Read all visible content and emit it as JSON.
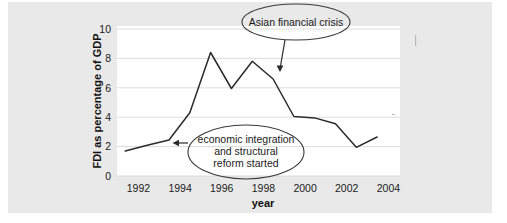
{
  "figure": {
    "background_color": "#e9e9e9",
    "plot_background_color": "#ffffff",
    "line_color": "#2a2a2a",
    "grid_color": "#d8d8d8"
  },
  "chart_data": {
    "type": "line",
    "title": "",
    "xlabel": "year",
    "ylabel": "FDI as percentage of GDP",
    "xlim": [
      1991,
      2004.6
    ],
    "ylim": [
      0,
      10
    ],
    "grid": true,
    "legend": "none",
    "xticks": [
      "1992",
      "1994",
      "1996",
      "1998",
      "2000",
      "2002",
      "2004"
    ],
    "xtick_values": [
      1992,
      1994,
      1996,
      1998,
      2000,
      2002,
      2004
    ],
    "yticks": [
      "0",
      "2",
      "4",
      "6",
      "8",
      "10"
    ],
    "ytick_values": [
      0,
      2,
      4,
      6,
      8,
      10
    ],
    "series": [
      {
        "name": "FDI as percentage of GDP",
        "x": [
          1991.4,
          1992.5,
          1993.5,
          1994.5,
          1995.5,
          1996.5,
          1997.5,
          1998.5,
          1999.5,
          2000.5,
          2001.5,
          2002.5,
          2003.5
        ],
        "values": [
          1.7,
          2.1,
          2.45,
          4.3,
          8.4,
          5.95,
          7.8,
          6.6,
          4.05,
          3.95,
          3.55,
          1.95,
          2.65
        ]
      }
    ],
    "annotations": [
      {
        "id": "asian-financial-crisis",
        "text_lines": [
          "Asian financial crisis"
        ],
        "target_x": 1998.1,
        "target_y": 7.35
      },
      {
        "id": "economic-integration",
        "text_lines": [
          "economic integration",
          "and structural",
          "reform started"
        ],
        "target_x": 1993.9,
        "target_y": 2.5
      }
    ]
  }
}
